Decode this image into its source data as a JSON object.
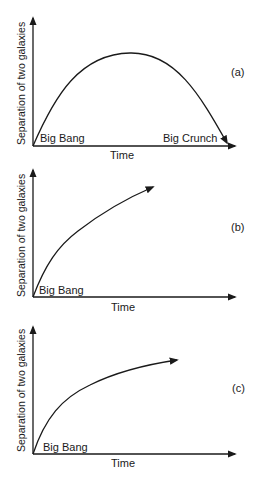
{
  "panels": [
    {
      "id": "a",
      "tag": "(a)",
      "ylabel": "Separation of two galaxies",
      "xlabel": "Time",
      "start_label": "Big Bang",
      "end_label": "Big Crunch",
      "curve": "rises to a maximum then falls back to zero"
    },
    {
      "id": "b",
      "tag": "(b)",
      "ylabel": "Separation of two galaxies",
      "xlabel": "Time",
      "start_label": "Big Bang",
      "curve": "increases continuously"
    },
    {
      "id": "c",
      "tag": "(c)",
      "ylabel": "Separation of two galaxies",
      "xlabel": "Time",
      "start_label": "Big Bang",
      "curve": "increases and levels off"
    }
  ]
}
